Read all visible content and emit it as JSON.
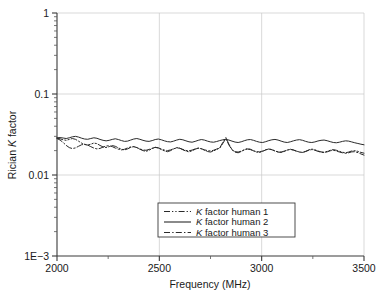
{
  "chart_data": {
    "type": "line",
    "title": "",
    "xlabel": "Frequency (MHz)",
    "ylabel": "Rician K factor",
    "ylabel_parts": {
      "pre": "Rician ",
      "italic": "K",
      "post": " factor"
    },
    "xlim": [
      2000,
      3500
    ],
    "ylim": [
      0.001,
      1
    ],
    "yscale": "log",
    "xscale": "linear",
    "grid": true,
    "legend_position": "lower-center-inside",
    "x_ticks": [
      {
        "value": 2000,
        "label": "2000",
        "major": true
      },
      {
        "value": 2250,
        "label": "",
        "major": false
      },
      {
        "value": 2500,
        "label": "2500",
        "major": true
      },
      {
        "value": 2750,
        "label": "",
        "major": false
      },
      {
        "value": 3000,
        "label": "3000",
        "major": true
      },
      {
        "value": 3250,
        "label": "",
        "major": false
      },
      {
        "value": 3500,
        "label": "3500",
        "major": true
      }
    ],
    "y_ticks": [
      {
        "value": 1,
        "label": "1",
        "major": true
      },
      {
        "value": 0.1,
        "label": "0.1",
        "major": true
      },
      {
        "value": 0.01,
        "label": "0.01",
        "major": true
      },
      {
        "value": 0.001,
        "label": "1E−3",
        "major": true
      }
    ],
    "legend": [
      {
        "label": "K factor human 1",
        "label_pre": "",
        "label_italic": "K",
        "label_post": " factor human 1",
        "style": "dash-dot-dot"
      },
      {
        "label": "K factor human 2",
        "label_pre": "",
        "label_italic": "K",
        "label_post": " factor human 2",
        "style": "solid"
      },
      {
        "label": "K factor human 3",
        "label_pre": "",
        "label_italic": "K",
        "label_post": " factor human 3",
        "style": "dash-dot"
      }
    ],
    "x": [
      2000,
      2015,
      2030,
      2045,
      2060,
      2075,
      2090,
      2105,
      2120,
      2135,
      2150,
      2165,
      2180,
      2195,
      2210,
      2225,
      2240,
      2255,
      2270,
      2285,
      2300,
      2315,
      2330,
      2345,
      2360,
      2375,
      2390,
      2405,
      2420,
      2435,
      2450,
      2465,
      2480,
      2495,
      2510,
      2525,
      2540,
      2555,
      2570,
      2585,
      2600,
      2615,
      2630,
      2645,
      2660,
      2675,
      2690,
      2705,
      2720,
      2735,
      2750,
      2765,
      2780,
      2795,
      2810,
      2825,
      2840,
      2855,
      2870,
      2885,
      2900,
      2915,
      2930,
      2945,
      2960,
      2975,
      2990,
      3005,
      3020,
      3035,
      3050,
      3065,
      3080,
      3095,
      3110,
      3125,
      3140,
      3155,
      3170,
      3185,
      3200,
      3215,
      3230,
      3245,
      3260,
      3275,
      3290,
      3305,
      3320,
      3335,
      3350,
      3365,
      3380,
      3395,
      3410,
      3425,
      3440,
      3455,
      3470,
      3485,
      3500
    ],
    "series": [
      {
        "name": "K factor human 1",
        "style": "dash-dot-dot",
        "values": [
          0.0285,
          0.028,
          0.0272,
          0.0268,
          0.0275,
          0.0282,
          0.0276,
          0.0262,
          0.0248,
          0.0238,
          0.0234,
          0.024,
          0.0248,
          0.0244,
          0.0232,
          0.0222,
          0.0218,
          0.0224,
          0.0231,
          0.0226,
          0.0216,
          0.0208,
          0.0204,
          0.021,
          0.0219,
          0.0224,
          0.0218,
          0.0208,
          0.02,
          0.0196,
          0.0202,
          0.0212,
          0.022,
          0.0216,
          0.0206,
          0.0198,
          0.0194,
          0.02,
          0.021,
          0.0218,
          0.0214,
          0.0205,
          0.0197,
          0.0193,
          0.0199,
          0.0208,
          0.0215,
          0.0211,
          0.0202,
          0.0195,
          0.0192,
          0.0198,
          0.0207,
          0.0216,
          0.0252,
          0.029,
          0.024,
          0.0206,
          0.0192,
          0.0188,
          0.0195,
          0.0205,
          0.0212,
          0.0208,
          0.0199,
          0.0192,
          0.019,
          0.0196,
          0.0204,
          0.021,
          0.0206,
          0.0198,
          0.0192,
          0.019,
          0.0195,
          0.0203,
          0.0208,
          0.0204,
          0.0197,
          0.0192,
          0.019,
          0.0196,
          0.0204,
          0.0209,
          0.0205,
          0.0198,
          0.0193,
          0.0191,
          0.0196,
          0.0202,
          0.0206,
          0.0202,
          0.0196,
          0.0191,
          0.0188,
          0.0192,
          0.0198,
          0.02,
          0.0196,
          0.019,
          0.0186
        ]
      },
      {
        "name": "K factor human 2",
        "style": "solid",
        "values": [
          0.0288,
          0.029,
          0.0286,
          0.0282,
          0.0288,
          0.0296,
          0.03,
          0.0294,
          0.0285,
          0.0278,
          0.0276,
          0.0282,
          0.0288,
          0.0284,
          0.0275,
          0.0268,
          0.0264,
          0.0268,
          0.0275,
          0.028,
          0.0274,
          0.0266,
          0.026,
          0.0262,
          0.027,
          0.0278,
          0.0282,
          0.0276,
          0.0268,
          0.0262,
          0.026,
          0.0266,
          0.0274,
          0.0278,
          0.0272,
          0.0264,
          0.0258,
          0.0256,
          0.0262,
          0.027,
          0.0276,
          0.0272,
          0.0264,
          0.0257,
          0.0254,
          0.026,
          0.0268,
          0.0274,
          0.027,
          0.0262,
          0.0256,
          0.0254,
          0.0259,
          0.0266,
          0.0272,
          0.0276,
          0.027,
          0.0262,
          0.0255,
          0.0252,
          0.0257,
          0.0265,
          0.0272,
          0.0274,
          0.0268,
          0.026,
          0.0254,
          0.0252,
          0.0258,
          0.0266,
          0.0272,
          0.0275,
          0.027,
          0.0262,
          0.0255,
          0.0252,
          0.0257,
          0.0264,
          0.027,
          0.0273,
          0.0268,
          0.026,
          0.0254,
          0.0252,
          0.0256,
          0.0263,
          0.0268,
          0.027,
          0.0265,
          0.0258,
          0.0252,
          0.025,
          0.0254,
          0.026,
          0.0264,
          0.0262,
          0.0256,
          0.025,
          0.0245,
          0.024,
          0.0236
        ]
      },
      {
        "name": "K factor human 3",
        "style": "dash-dot",
        "values": [
          0.0282,
          0.027,
          0.0252,
          0.0232,
          0.0218,
          0.0212,
          0.0216,
          0.0226,
          0.0236,
          0.024,
          0.0234,
          0.0224,
          0.0215,
          0.021,
          0.0213,
          0.0221,
          0.0228,
          0.023,
          0.0224,
          0.0215,
          0.0208,
          0.0204,
          0.0208,
          0.0216,
          0.0222,
          0.0224,
          0.0218,
          0.021,
          0.0204,
          0.0202,
          0.0207,
          0.0214,
          0.0219,
          0.0216,
          0.0209,
          0.0203,
          0.02,
          0.0204,
          0.0211,
          0.0216,
          0.0214,
          0.0207,
          0.0201,
          0.0199,
          0.0203,
          0.021,
          0.0214,
          0.0211,
          0.0205,
          0.02,
          0.0198,
          0.0202,
          0.0209,
          0.0214,
          0.0245,
          0.0282,
          0.0235,
          0.0204,
          0.0194,
          0.0192,
          0.0197,
          0.0204,
          0.0209,
          0.0206,
          0.0199,
          0.0194,
          0.0193,
          0.0198,
          0.0205,
          0.0209,
          0.0205,
          0.0198,
          0.0193,
          0.0192,
          0.0197,
          0.0203,
          0.0207,
          0.0203,
          0.0197,
          0.0192,
          0.019,
          0.0195,
          0.0202,
          0.0206,
          0.0202,
          0.0196,
          0.0191,
          0.0189,
          0.0193,
          0.0199,
          0.0202,
          0.0198,
          0.0192,
          0.0188,
          0.0185,
          0.0188,
          0.0193,
          0.0194,
          0.0189,
          0.0182,
          0.0176
        ]
      }
    ]
  }
}
